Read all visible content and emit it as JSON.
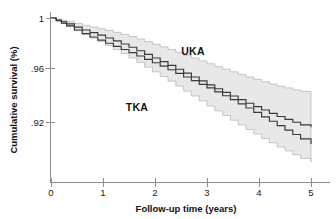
{
  "chart_data": {
    "type": "line",
    "title": "",
    "subtitle": "",
    "xlabel": "Follow-up time (years)",
    "ylabel": "Cumulative survival (%)",
    "xlim": [
      0,
      5
    ],
    "ylim": [
      0.88,
      1.0
    ],
    "xticks": [
      0,
      1,
      2,
      3,
      4,
      5
    ],
    "xticklabels": [
      "0",
      "1",
      "2",
      "3",
      "4",
      "5"
    ],
    "yticks": [
      1.0,
      0.96,
      0.92
    ],
    "yticklabels": [
      "1",
      ".96",
      ".92"
    ],
    "grid": false,
    "legend_position": "inline-annotation",
    "annotations": [
      {
        "text": "UKA",
        "x": 2.5,
        "y": 0.977
      },
      {
        "text": "TKA",
        "x": 1.5,
        "y": 0.935
      }
    ],
    "series": [
      {
        "name": "UKA",
        "color": "#3a3a3a",
        "band_fill": "#e8e8e8",
        "band_stroke": "#b3b3b3",
        "x": [
          0.0,
          0.1,
          0.2,
          0.3,
          0.45,
          0.6,
          0.75,
          0.9,
          1.05,
          1.2,
          1.35,
          1.5,
          1.65,
          1.8,
          1.95,
          2.1,
          2.25,
          2.4,
          2.55,
          2.7,
          2.85,
          3.0,
          3.15,
          3.3,
          3.45,
          3.6,
          3.75,
          3.9,
          4.05,
          4.2,
          4.35,
          4.5,
          4.65,
          4.8,
          5.0
        ],
        "values": [
          1.0,
          0.9985,
          0.997,
          0.9955,
          0.993,
          0.9908,
          0.9888,
          0.9868,
          0.9846,
          0.9824,
          0.98,
          0.9775,
          0.9748,
          0.972,
          0.9692,
          0.9664,
          0.9636,
          0.9606,
          0.9576,
          0.9546,
          0.9516,
          0.9486,
          0.9456,
          0.9428,
          0.94,
          0.9372,
          0.9344,
          0.9318,
          0.9292,
          0.9266,
          0.9242,
          0.922,
          0.9198,
          0.9178,
          0.916
        ],
        "ci_upper": [
          1.0,
          0.9992,
          0.9983,
          0.9974,
          0.9958,
          0.9944,
          0.9931,
          0.9918,
          0.9904,
          0.989,
          0.9874,
          0.9857,
          0.9838,
          0.9818,
          0.9798,
          0.9778,
          0.9758,
          0.9736,
          0.9714,
          0.9692,
          0.967,
          0.9648,
          0.9626,
          0.9606,
          0.9586,
          0.9566,
          0.9546,
          0.9528,
          0.951,
          0.9492,
          0.9476,
          0.9462,
          0.9448,
          0.9436,
          0.9426
        ],
        "ci_lower": [
          1.0,
          0.9978,
          0.9957,
          0.9936,
          0.9902,
          0.9872,
          0.9845,
          0.9818,
          0.9788,
          0.9758,
          0.9726,
          0.9693,
          0.9658,
          0.9622,
          0.9586,
          0.955,
          0.9514,
          0.9476,
          0.9438,
          0.94,
          0.9362,
          0.9324,
          0.9286,
          0.925,
          0.9214,
          0.9178,
          0.9142,
          0.9108,
          0.9074,
          0.904,
          0.9008,
          0.8978,
          0.8948,
          0.892,
          0.8894
        ]
      },
      {
        "name": "TKA",
        "color": "#2e2e2e",
        "x": [
          0.0,
          0.1,
          0.2,
          0.3,
          0.45,
          0.6,
          0.75,
          0.9,
          1.05,
          1.2,
          1.35,
          1.5,
          1.65,
          1.8,
          1.95,
          2.1,
          2.25,
          2.4,
          2.55,
          2.7,
          2.85,
          3.0,
          3.15,
          3.3,
          3.45,
          3.6,
          3.75,
          3.9,
          4.05,
          4.2,
          4.35,
          4.5,
          4.65,
          4.8,
          5.0
        ],
        "values": [
          1.0,
          0.998,
          0.996,
          0.994,
          0.9908,
          0.988,
          0.9854,
          0.983,
          0.9806,
          0.9782,
          0.9758,
          0.9734,
          0.9708,
          0.9682,
          0.9656,
          0.963,
          0.9602,
          0.9574,
          0.9546,
          0.9518,
          0.949,
          0.9462,
          0.9432,
          0.9402,
          0.9372,
          0.934,
          0.9308,
          0.9274,
          0.924,
          0.9206,
          0.9172,
          0.9138,
          0.9104,
          0.907,
          0.903
        ]
      }
    ]
  },
  "axes": {
    "x_title": "Follow-up time (years)",
    "y_title": "Cumulative survival (%)",
    "x_tick_labels": [
      "0",
      "1",
      "2",
      "3",
      "4",
      "5"
    ],
    "y_tick_labels": [
      "1",
      ".96",
      ".92"
    ]
  },
  "labels": {
    "uka": "UKA",
    "tka": "TKA"
  },
  "colors": {
    "curve": "#3a3a3a",
    "band_fill": "#e8e8e8",
    "band_stroke": "#b3b3b3",
    "axis": "#8e8e8e",
    "text": "#111111",
    "background": "#ffffff"
  }
}
